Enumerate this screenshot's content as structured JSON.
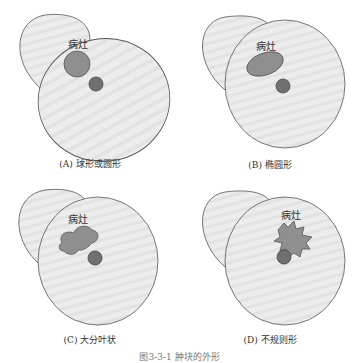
{
  "diagram": {
    "lesion_label": "病灶",
    "colors": {
      "organ_fill": "#e9e9e9",
      "organ_stroke": "#555555",
      "lesion_fill": "#8f8f8f",
      "vessel_fill": "#707070",
      "stroke": "#444444"
    },
    "panels": [
      {
        "id": "A",
        "caption": "(A) 球形或圆形",
        "shape": "circle"
      },
      {
        "id": "B",
        "caption": "(B) 椭圆形",
        "shape": "ellipse"
      },
      {
        "id": "C",
        "caption": "(C) 大分叶状",
        "shape": "lobulated"
      },
      {
        "id": "D",
        "caption": "(D) 不规则形",
        "shape": "irregular"
      }
    ],
    "figure_caption": "图3-3-1 肿块的外形"
  }
}
